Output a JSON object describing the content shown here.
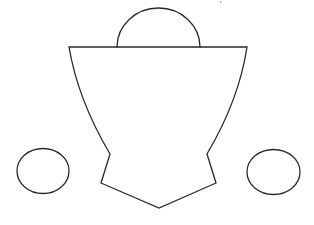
{
  "diagram": {
    "stroke_color": "#2a2a2a",
    "background": "#ffffff",
    "shapes": {
      "dome": {
        "type": "semicircle",
        "cx": 158.5,
        "cy": 47,
        "rx": 41.5,
        "ry": 39
      },
      "top_bar": {
        "type": "line",
        "x1": 69,
        "y1": 47,
        "x2": 247,
        "y2": 47
      },
      "cup_body": {
        "type": "path",
        "points": {
          "top_left": [
            69,
            47
          ],
          "waist_left": [
            110,
            154
          ],
          "notch_left": [
            101,
            183
          ],
          "bottom": [
            159,
            208
          ],
          "notch_right": [
            216,
            183
          ],
          "waist_right": [
            207,
            154
          ],
          "top_right": [
            247,
            47
          ]
        }
      },
      "left_oval": {
        "type": "ellipse",
        "cx": 43,
        "cy": 171,
        "rx": 26,
        "ry": 22.5
      },
      "right_oval": {
        "type": "ellipse",
        "cx": 273.5,
        "cy": 172,
        "rx": 26.5,
        "ry": 22.5
      }
    }
  }
}
